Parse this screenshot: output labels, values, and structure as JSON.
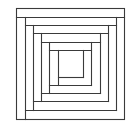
{
  "diagram": {
    "title": "Log cabin quilt block",
    "width": 126,
    "height": 127,
    "background": "#ffffff",
    "stroke_color": "#3a3a3a",
    "stroke_width": 1.1,
    "outer_square": {
      "x": 16,
      "y": 8,
      "w": 108,
      "h": 111
    },
    "center_square": {
      "x": 58,
      "y": 50,
      "w": 25,
      "h": 27
    },
    "segments": [
      [
        16,
        17,
        124,
        17
      ],
      [
        25,
        17,
        25,
        119
      ],
      [
        25,
        110,
        116,
        110
      ],
      [
        116,
        17,
        116,
        110
      ],
      [
        25,
        25,
        116,
        25
      ],
      [
        33,
        25,
        33,
        110
      ],
      [
        33,
        101,
        108,
        101
      ],
      [
        108,
        25,
        108,
        101
      ],
      [
        33,
        33,
        108,
        33
      ],
      [
        41,
        33,
        41,
        101
      ],
      [
        41,
        93,
        100,
        93
      ],
      [
        100,
        33,
        100,
        93
      ],
      [
        41,
        42,
        100,
        42
      ],
      [
        49,
        42,
        49,
        93
      ],
      [
        49,
        85,
        91,
        85
      ],
      [
        91,
        42,
        91,
        85
      ],
      [
        49,
        50,
        91,
        50
      ],
      [
        58,
        50,
        58,
        85
      ],
      [
        58,
        77,
        83,
        77
      ],
      [
        83,
        50,
        83,
        77
      ]
    ]
  }
}
